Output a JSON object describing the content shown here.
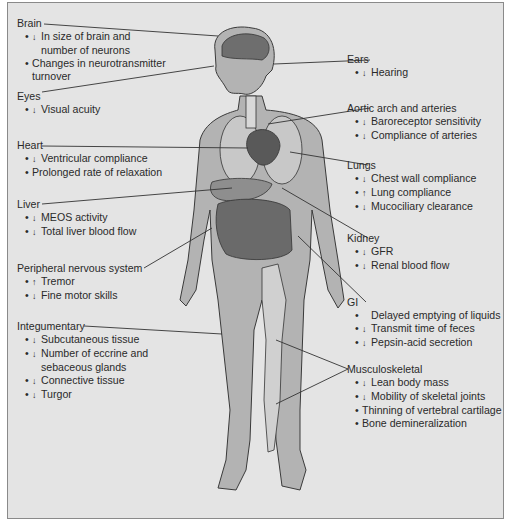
{
  "diagram": {
    "type": "anatomical-label-diagram",
    "colors": {
      "background": "#e4e4e4",
      "border": "#8a8a8a",
      "text": "#2a2a2a",
      "body": "#a9a9a9",
      "leader": "#333333"
    },
    "arrow_glyphs": {
      "decrease": "↓",
      "increase": "↑"
    },
    "left": [
      {
        "title": "Brain",
        "items": [
          {
            "dir": "↓",
            "text": "In size of brain and",
            "cont": "number of neurons"
          },
          {
            "dir": "",
            "text": "Changes in neurotransmitter",
            "cont": "turnover"
          }
        ]
      },
      {
        "title": "Eyes",
        "items": [
          {
            "dir": "↓",
            "text": "Visual acuity"
          }
        ]
      },
      {
        "title": "Heart",
        "items": [
          {
            "dir": "↓",
            "text": "Ventricular compliance"
          },
          {
            "dir": "",
            "text": "Prolonged rate of relaxation"
          }
        ]
      },
      {
        "title": "Liver",
        "items": [
          {
            "dir": "↓",
            "text": "MEOS activity"
          },
          {
            "dir": "↓",
            "text": "Total liver blood flow"
          }
        ]
      },
      {
        "title": "Peripheral nervous system",
        "items": [
          {
            "dir": "↑",
            "text": "Tremor"
          },
          {
            "dir": "↓",
            "text": "Fine motor skills"
          }
        ]
      },
      {
        "title": "Integumentary",
        "items": [
          {
            "dir": "↓",
            "text": "Subcutaneous tissue"
          },
          {
            "dir": "↓",
            "text": "Number of eccrine and",
            "cont": "sebaceous glands"
          },
          {
            "dir": "↓",
            "text": "Connective tissue"
          },
          {
            "dir": "↓",
            "text": "Turgor"
          }
        ]
      }
    ],
    "right": [
      {
        "title": "Ears",
        "items": [
          {
            "dir": "↓",
            "text": "Hearing"
          }
        ]
      },
      {
        "title": "Aortic arch and arteries",
        "items": [
          {
            "dir": "↓",
            "text": "Baroreceptor sensitivity"
          },
          {
            "dir": "↓",
            "text": "Compliance of arteries"
          }
        ]
      },
      {
        "title": "Lungs",
        "items": [
          {
            "dir": "↓",
            "text": "Chest wall compliance"
          },
          {
            "dir": "↑",
            "text": "Lung compliance"
          },
          {
            "dir": "↓",
            "text": "Mucociliary clearance"
          }
        ]
      },
      {
        "title": "Kidney",
        "items": [
          {
            "dir": "↓",
            "text": "GFR"
          },
          {
            "dir": "↓",
            "text": "Renal blood flow"
          }
        ]
      },
      {
        "title": "GI",
        "items": [
          {
            "dir": "",
            "text": "Delayed emptying of liquids"
          },
          {
            "dir": "↓",
            "text": "Transmit time of feces"
          },
          {
            "dir": "↓",
            "text": "Pepsin-acid secretion"
          }
        ]
      },
      {
        "title": "Musculoskeletal",
        "items": [
          {
            "dir": "↓",
            "text": "Lean body mass"
          },
          {
            "dir": "↓",
            "text": "Mobility of skeletal joints"
          },
          {
            "dir": "",
            "text": "Thinning of vertebral cartilage"
          },
          {
            "dir": "",
            "text": "Bone demineralization"
          }
        ]
      }
    ]
  }
}
